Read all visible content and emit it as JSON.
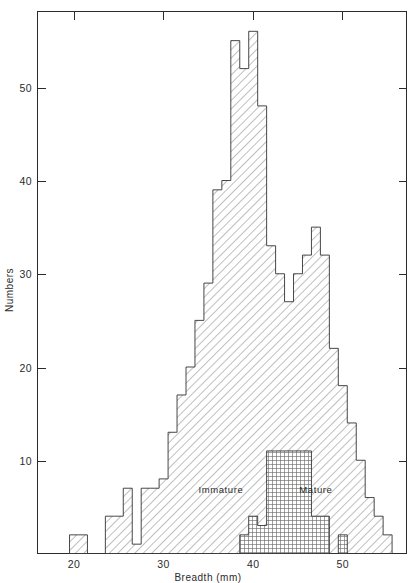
{
  "chart_data": {
    "type": "bar",
    "title": "",
    "subtitle": "",
    "xlabel": "Breadth (mm)",
    "ylabel": "Numbers",
    "xlim": [
      18,
      56
    ],
    "ylim": [
      0,
      58
    ],
    "xticks": [
      20,
      30,
      40,
      50
    ],
    "yticks": [
      10,
      20,
      30,
      40,
      50
    ],
    "xtick_labels": [
      "20",
      "30",
      "40",
      "50"
    ],
    "ytick_labels": [
      "10",
      "20",
      "30",
      "40",
      "50"
    ],
    "grid": false,
    "legend_position": "inline-annotation",
    "bin_width": 1,
    "series": [
      {
        "name": "Immature",
        "fill": "diagonal-hatch",
        "annotation": "Immature",
        "annotation_x": 36.4,
        "annotation_y": 6.5,
        "bins": [
          20,
          21,
          22,
          23,
          24,
          25,
          26,
          27,
          28,
          29,
          30,
          31,
          32,
          33,
          34,
          35,
          36,
          37,
          38,
          39,
          40,
          41,
          42,
          43,
          44,
          45,
          46,
          47,
          48,
          49,
          50,
          51,
          52,
          53,
          54,
          55
        ],
        "values": [
          2,
          2,
          0,
          0,
          4,
          4,
          7,
          1,
          7,
          7,
          8,
          13,
          17,
          20,
          25,
          29,
          39,
          40,
          55,
          52,
          56,
          48,
          33,
          30,
          27,
          30,
          32,
          35,
          32,
          22,
          18,
          14,
          10,
          6,
          4,
          2
        ]
      },
      {
        "name": "Mature",
        "fill": "cross-hatch",
        "annotation": "Mature",
        "annotation_x": 47.0,
        "annotation_y": 6.5,
        "bins": [
          39,
          40,
          41,
          42,
          43,
          44,
          45,
          46,
          47,
          48,
          49,
          50,
          51,
          52,
          53,
          54,
          55
        ],
        "values": [
          2,
          4,
          3,
          11,
          11,
          11,
          11,
          11,
          4,
          4,
          0,
          2,
          0,
          0,
          0,
          0,
          0
        ]
      }
    ]
  },
  "axes": {
    "x_axis_title": "Breadth (mm)",
    "y_axis_title": "Numbers"
  },
  "annotations": {
    "immature": "Immature",
    "mature": "Mature"
  }
}
